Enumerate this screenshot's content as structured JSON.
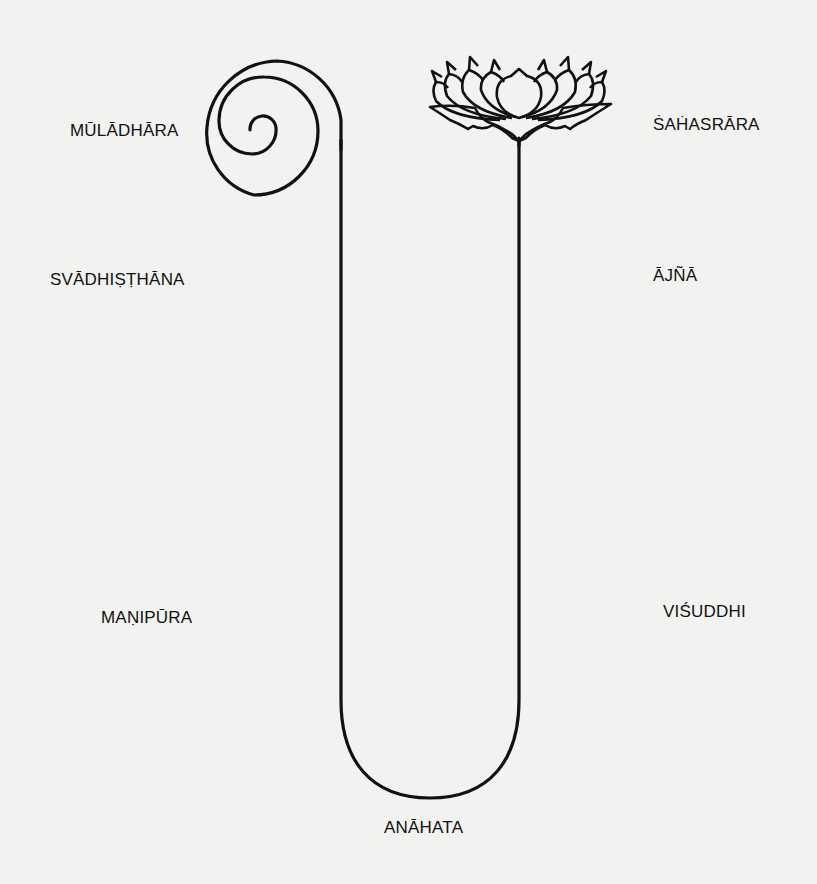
{
  "diagram": {
    "type": "chakra-nadi-diagram",
    "elements": {
      "spiral": "coiled-spiral (kundalini)",
      "channel": "U-shaped channel",
      "lotus": "thousand-petaled lotus"
    },
    "labels": {
      "muladhara": "MŪLĀDHĀRA",
      "svadhisthana": "SVĀDHIṢṬHĀNA",
      "manipura": "MAṆIPŪRA",
      "anahata": "ANĀHATA",
      "visuddhi": "VIŚUDDHI",
      "ajna": "ĀJÑĀ",
      "sahasrara": "ṠAḢASRĀRA"
    },
    "colors": {
      "ink": "#111111",
      "paper": "#f2f2f0"
    }
  }
}
